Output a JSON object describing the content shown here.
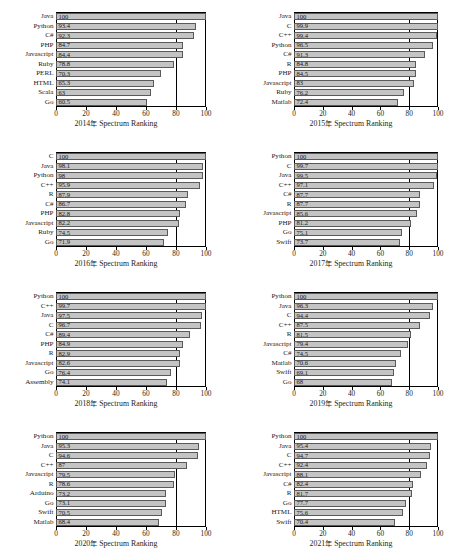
{
  "figure": {
    "type": "bar-chart-grid",
    "rows": 4,
    "cols": 2,
    "caption_partial": "",
    "bar_color": "#c4c4c4",
    "bar_border_color": "#5a5a5a",
    "axis_color": "#000000",
    "text_color": "#1a1a1a"
  },
  "axis": {
    "ticks": [
      0,
      20,
      40,
      60,
      80,
      100
    ],
    "tick_labels": [
      "0",
      "20",
      "40",
      "60",
      "80",
      "100"
    ],
    "xmin": 0,
    "xmax": 100,
    "gridlines": [
      80,
      100
    ],
    "grid": false
  },
  "chart_data": [
    {
      "type": "bar",
      "orientation": "horizontal",
      "title": "",
      "xlabel": "2014年 Spectrum Ranking",
      "year": "2014",
      "ylabel": "",
      "xlim": [
        0,
        100
      ],
      "categories": [
        "Java",
        "Python",
        "C#",
        "PHP",
        "Javascript",
        "Ruby",
        "PERL",
        "HTML",
        "Scala",
        "Go"
      ],
      "values": [
        100,
        93.4,
        92.3,
        84.7,
        84.4,
        78.8,
        70.3,
        65.3,
        63,
        60.5
      ],
      "value_labels": [
        "100",
        "93.4",
        "92.3",
        "84.7",
        "84.4",
        "78.8",
        "70.3",
        "65.3",
        "63",
        "60.5"
      ]
    },
    {
      "type": "bar",
      "orientation": "horizontal",
      "title": "",
      "xlabel": "2015年 Spectrum Ranking",
      "year": "2015",
      "ylabel": "",
      "xlim": [
        0,
        100
      ],
      "categories": [
        "Java",
        "C",
        "C++",
        "Python",
        "C#",
        "R",
        "PHP",
        "Javascript",
        "Ruby",
        "Matlab"
      ],
      "values": [
        100,
        99.9,
        99.4,
        96.5,
        91.3,
        84.8,
        84.5,
        83,
        76.2,
        72.4
      ],
      "value_labels": [
        "100",
        "99.9",
        "99.4",
        "96.5",
        "91.3",
        "84.8",
        "84.5",
        "83",
        "76.2",
        "72.4"
      ]
    },
    {
      "type": "bar",
      "orientation": "horizontal",
      "title": "",
      "xlabel": "2016年 Spectrum Ranking",
      "year": "2016",
      "ylabel": "",
      "xlim": [
        0,
        100
      ],
      "categories": [
        "C",
        "Java",
        "Python",
        "C++",
        "R",
        "C#",
        "PHP",
        "Javascript",
        "Ruby",
        "Go"
      ],
      "values": [
        100,
        98.1,
        98,
        95.9,
        87.9,
        86.7,
        82.8,
        82.2,
        74.5,
        71.9
      ],
      "value_labels": [
        "100",
        "98.1",
        "98",
        "95.9",
        "87.9",
        "86.7",
        "82.8",
        "82.2",
        "74.5",
        "71.9"
      ]
    },
    {
      "type": "bar",
      "orientation": "horizontal",
      "title": "",
      "xlabel": "2017年 Spectrum Ranking",
      "year": "2017",
      "ylabel": "",
      "xlim": [
        0,
        100
      ],
      "categories": [
        "Python",
        "C",
        "Java",
        "C++",
        "C#",
        "R",
        "Javascript",
        "PHP",
        "Go",
        "Swift"
      ],
      "values": [
        100,
        99.7,
        99.5,
        97.1,
        87.7,
        87.7,
        85.6,
        81.2,
        75.1,
        73.7
      ],
      "value_labels": [
        "100",
        "99.7",
        "99.5",
        "97.1",
        "87.7",
        "87.7",
        "85.6",
        "81.2",
        "75.1",
        "73.7"
      ]
    },
    {
      "type": "bar",
      "orientation": "horizontal",
      "title": "",
      "xlabel": "2018年 Spectrum Ranking",
      "year": "2018",
      "ylabel": "",
      "xlim": [
        0,
        100
      ],
      "categories": [
        "Python",
        "C++",
        "Java",
        "C",
        "C#",
        "PHP",
        "R",
        "Javascript",
        "Go",
        "Assembly"
      ],
      "values": [
        100,
        99.7,
        97.5,
        96.7,
        89.4,
        84.9,
        82.9,
        82.6,
        76.4,
        74.1
      ],
      "value_labels": [
        "100",
        "99.7",
        "97.5",
        "96.7",
        "89.4",
        "84.9",
        "82.9",
        "82.6",
        "76.4",
        "74.1"
      ]
    },
    {
      "type": "bar",
      "orientation": "horizontal",
      "title": "",
      "xlabel": "2019年 Spectrum Ranking",
      "year": "2019",
      "ylabel": "",
      "xlim": [
        0,
        100
      ],
      "categories": [
        "Python",
        "Java",
        "C",
        "C++",
        "R",
        "Javascript",
        "C#",
        "Matlab",
        "Swift",
        "Go"
      ],
      "values": [
        100,
        96.3,
        94.4,
        87.5,
        81.5,
        79.4,
        74.5,
        70.6,
        69.1,
        68
      ],
      "value_labels": [
        "100",
        "96.3",
        "94.4",
        "87.5",
        "81.5",
        "79.4",
        "74.5",
        "70.6",
        "69.1",
        "68"
      ]
    },
    {
      "type": "bar",
      "orientation": "horizontal",
      "title": "",
      "xlabel": "2020年 Spectrum Ranking",
      "year": "2020",
      "ylabel": "",
      "xlim": [
        0,
        100
      ],
      "categories": [
        "Python",
        "Java",
        "C",
        "C++",
        "Javascript",
        "R",
        "Arduino",
        "Go",
        "Swift",
        "Matlab"
      ],
      "values": [
        100,
        95.3,
        94.6,
        87,
        79.5,
        78.6,
        73.2,
        73.1,
        70.5,
        68.4
      ],
      "value_labels": [
        "100",
        "95.3",
        "94.6",
        "87",
        "79.5",
        "78.6",
        "73.2",
        "73.1",
        "70.5",
        "68.4"
      ]
    },
    {
      "type": "bar",
      "orientation": "horizontal",
      "title": "",
      "xlabel": "2021年 Spectrum Ranking",
      "year": "2021",
      "ylabel": "",
      "xlim": [
        0,
        100
      ],
      "categories": [
        "Python",
        "Java",
        "C",
        "C++",
        "Javascript",
        "C#",
        "R",
        "Go",
        "HTML",
        "Swift"
      ],
      "values": [
        100,
        95.4,
        94.7,
        92.4,
        88.1,
        82.4,
        81.7,
        77.7,
        75.6,
        70.4
      ],
      "value_labels": [
        "100",
        "95.4",
        "94.7",
        "92.4",
        "88.1",
        "82.4",
        "81.7",
        "77.7",
        "75.6",
        "70.4"
      ]
    }
  ]
}
